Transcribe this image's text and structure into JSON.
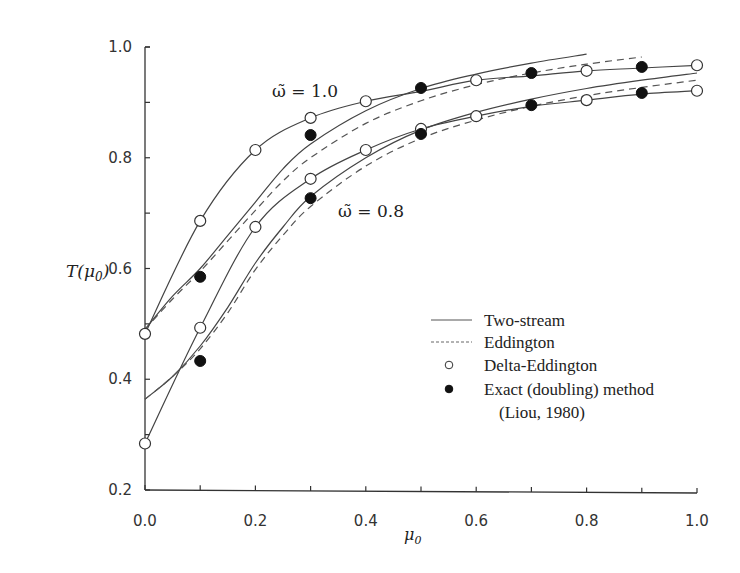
{
  "chart_data": {
    "type": "line",
    "title": "",
    "xlabel": "μ0",
    "ylabel": "T(μ0)",
    "xlim": [
      0.0,
      1.0
    ],
    "ylim": [
      0.2,
      1.0
    ],
    "xticks": [
      0.0,
      0.1,
      0.2,
      0.3,
      0.4,
      0.5,
      0.6,
      0.7,
      0.8,
      0.9,
      1.0
    ],
    "xtick_labels": [
      "0.0",
      "0.2",
      "0.4",
      "0.6",
      "0.8",
      "1.0"
    ],
    "xtick_label_values": [
      0.0,
      0.2,
      0.4,
      0.6,
      0.8,
      1.0
    ],
    "yticks": [
      0.2,
      0.3,
      0.4,
      0.5,
      0.6,
      0.7,
      0.8,
      0.9,
      1.0
    ],
    "ytick_labels": [
      "0.2",
      "0.4",
      "0.6",
      "0.8",
      "1.0"
    ],
    "ytick_label_values": [
      0.2,
      0.4,
      0.6,
      0.8,
      1.0
    ],
    "grid": false,
    "legend_position": "lower right",
    "annotations": [
      {
        "text": "ω̃ = 1.0",
        "x": 0.22,
        "y": 0.9
      },
      {
        "text": "ω̃ = 0.8",
        "x": 0.35,
        "y": 0.735
      }
    ],
    "series": [
      {
        "name": "Two-stream (ω̃ = 1.0)",
        "method": "Two-stream",
        "omega": 1.0,
        "style": "solid",
        "x": [
          0.0,
          0.05,
          0.1,
          0.15,
          0.2,
          0.25,
          0.3,
          0.4,
          0.5,
          0.6,
          0.7,
          0.8
        ],
        "values": [
          0.49,
          0.55,
          0.6,
          0.66,
          0.72,
          0.78,
          0.825,
          0.885,
          0.925,
          0.951,
          0.971,
          0.987
        ]
      },
      {
        "name": "Eddington (ω̃ = 1.0)",
        "method": "Eddington",
        "omega": 1.0,
        "style": "dashed",
        "x": [
          0.0,
          0.05,
          0.1,
          0.15,
          0.2,
          0.25,
          0.3,
          0.4,
          0.5,
          0.6,
          0.7,
          0.8,
          0.9
        ],
        "values": [
          0.49,
          0.545,
          0.595,
          0.65,
          0.705,
          0.758,
          0.8,
          0.862,
          0.903,
          0.932,
          0.953,
          0.969,
          0.982
        ]
      },
      {
        "name": "Two-stream (ω̃ = 0.8)",
        "method": "Two-stream",
        "omega": 0.8,
        "style": "solid",
        "x": [
          0.0,
          0.05,
          0.1,
          0.15,
          0.2,
          0.25,
          0.3,
          0.4,
          0.5,
          0.6,
          0.7,
          0.8,
          0.9,
          1.0
        ],
        "values": [
          0.364,
          0.405,
          0.46,
          0.53,
          0.61,
          0.675,
          0.73,
          0.8,
          0.85,
          0.882,
          0.906,
          0.925,
          0.94,
          0.953
        ]
      },
      {
        "name": "Eddington (ω̃ = 0.8)",
        "method": "Eddington",
        "omega": 0.8,
        "style": "dashed",
        "x": [
          0.0,
          0.05,
          0.1,
          0.15,
          0.2,
          0.25,
          0.3,
          0.4,
          0.5,
          0.6,
          0.7,
          0.8,
          0.9,
          1.0
        ],
        "values": [
          0.364,
          0.405,
          0.455,
          0.52,
          0.598,
          0.66,
          0.712,
          0.785,
          0.835,
          0.868,
          0.893,
          0.912,
          0.927,
          0.94
        ]
      },
      {
        "name": "Delta-Eddington (ω̃ = 1.0)",
        "method": "Delta-Eddington",
        "omega": 1.0,
        "style": "open-marker-line",
        "x": [
          0.0,
          0.1,
          0.2,
          0.3,
          0.4,
          0.5,
          0.6,
          0.7,
          0.8,
          0.9,
          1.0
        ],
        "values": [
          0.482,
          0.686,
          0.814,
          0.872,
          0.902,
          0.92,
          0.94,
          0.948,
          0.957,
          0.962,
          0.967
        ],
        "marker_x": [
          0.0,
          0.1,
          0.2,
          0.3,
          0.4,
          0.6,
          0.8,
          1.0
        ],
        "marker_values": [
          0.482,
          0.686,
          0.814,
          0.872,
          0.902,
          0.94,
          0.957,
          0.967
        ]
      },
      {
        "name": "Exact (doubling) method (ω̃ = 1.0)",
        "method": "Exact (doubling)",
        "omega": 1.0,
        "style": "filled-marker",
        "x": [
          0.1,
          0.3,
          0.5,
          0.7,
          0.9
        ],
        "values": [
          0.585,
          0.841,
          0.926,
          0.953,
          0.964
        ]
      },
      {
        "name": "Delta-Eddington (ω̃ = 0.8)",
        "method": "Delta-Eddington",
        "omega": 0.8,
        "style": "open-marker-line",
        "x": [
          0.0,
          0.1,
          0.2,
          0.3,
          0.4,
          0.5,
          0.6,
          0.7,
          0.8,
          0.9,
          1.0
        ],
        "values": [
          0.284,
          0.493,
          0.675,
          0.762,
          0.814,
          0.852,
          0.875,
          0.893,
          0.904,
          0.915,
          0.921
        ],
        "marker_x": [
          0.0,
          0.1,
          0.2,
          0.3,
          0.4,
          0.5,
          0.6,
          0.8,
          1.0
        ],
        "marker_values": [
          0.284,
          0.493,
          0.675,
          0.762,
          0.814,
          0.852,
          0.875,
          0.904,
          0.921
        ]
      },
      {
        "name": "Exact (doubling) method (ω̃ = 0.8)",
        "method": "Exact (doubling)",
        "omega": 0.8,
        "style": "filled-marker",
        "x": [
          0.1,
          0.3,
          0.5,
          0.7,
          0.9
        ],
        "values": [
          0.433,
          0.727,
          0.843,
          0.895,
          0.917
        ]
      }
    ]
  },
  "axes": {
    "ylabel_main": "T(μ",
    "ylabel_sub": "0",
    "ylabel_close": ")",
    "xlabel_main": "μ",
    "xlabel_sub": "0"
  },
  "annotations": {
    "omega_high": "ω̃ = 1.0",
    "omega_low": "ω̃ = 0.8"
  },
  "legend": {
    "items": [
      {
        "label": "Two-stream",
        "symbol": "solid-line"
      },
      {
        "label": "Eddington",
        "symbol": "dashed-line"
      },
      {
        "label": "Delta-Eddington",
        "symbol": "open-circle"
      },
      {
        "label": "Exact (doubling) method",
        "symbol": "filled-circle"
      }
    ],
    "citation": "(Liou, 1980)"
  }
}
